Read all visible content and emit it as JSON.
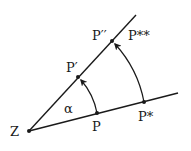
{
  "diagram": {
    "type": "rotation-about-center",
    "stroke_color": "#1a1a1a",
    "background": "#ffffff",
    "center": {
      "label": "Z",
      "x": 29,
      "y": 131
    },
    "angle_label": "α",
    "rays": [
      {
        "name": "lower-ray",
        "from": [
          29,
          131
        ],
        "to": [
          178,
          93
        ]
      },
      {
        "name": "upper-ray",
        "from": [
          29,
          131
        ],
        "to": [
          136,
          15
        ]
      }
    ],
    "points": [
      {
        "label": "P",
        "x": 97,
        "y": 113
      },
      {
        "label": "P*",
        "x": 144,
        "y": 102
      },
      {
        "label": "P′",
        "x": 78,
        "y": 77
      },
      {
        "label": "P′′",
        "x": 112,
        "y": 41
      }
    ],
    "arcs": [
      {
        "name": "arc-P-to-P-prime",
        "from": "P",
        "to": "P′",
        "arrow": "end"
      },
      {
        "name": "arc-Pstar-to-Pdoubleprime",
        "from": "P*",
        "to": "P′′",
        "arrow": "end"
      }
    ],
    "labels": {
      "Z": "Z",
      "P": "P",
      "P_star": "P*",
      "P_prime": "P′",
      "P_double_prime": "P′′",
      "P_double_star": "P**",
      "alpha": "α"
    }
  }
}
